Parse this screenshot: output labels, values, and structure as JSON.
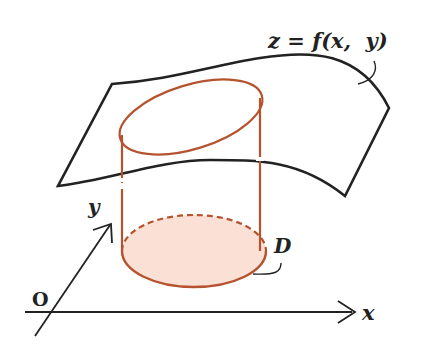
{
  "figure": {
    "labels": {
      "surface": "z = f(x,  y)",
      "region": "D",
      "origin": "O",
      "x_axis": "x",
      "y_axis": "y"
    },
    "colors": {
      "ink": "#222222",
      "cylinder": "#b5532f",
      "region_fill": "#fbe0d6"
    }
  }
}
